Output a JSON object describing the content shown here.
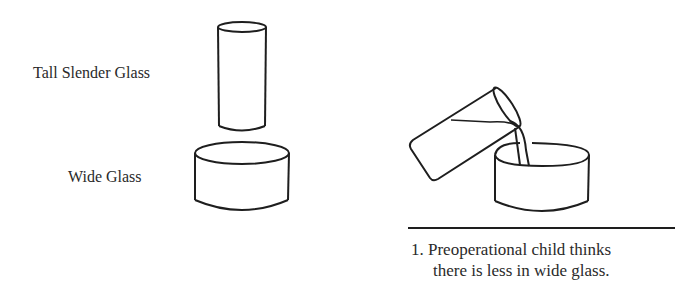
{
  "labels": {
    "tall_glass": "Tall Slender Glass",
    "wide_glass": "Wide Glass"
  },
  "caption": {
    "line1": "1. Preoperational child thinks",
    "line2": "there is less in wide glass."
  },
  "colors": {
    "stroke": "#1e1e1e",
    "background": "#ffffff"
  }
}
